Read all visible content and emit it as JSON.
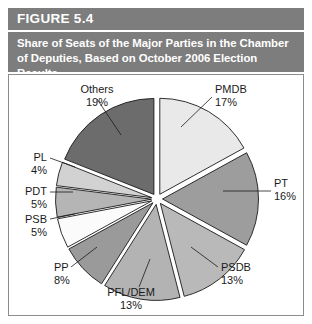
{
  "figure": {
    "number_label": "FIGURE 5.4",
    "caption": "Share of Seats of the Major Parties in the Chamber of Deputies, Based on October 2006 Election Results",
    "header_color": "#7d7d7d",
    "panel_background": "#ffffff",
    "border_color": "#8c8c8c"
  },
  "chart_data": {
    "type": "pie",
    "title": "Share of Seats of the Major Parties in the Chamber of Deputies, Based on October 2006 Election Results",
    "xlabel": "",
    "ylabel": "",
    "exploded": true,
    "legend": "none",
    "labels_placement": "outside-with-leader-lines",
    "categories": [
      "PMDB",
      "PT",
      "PSDB",
      "PFL/DEM",
      "PP",
      "PSB",
      "PDT",
      "PL",
      "Others"
    ],
    "values": [
      17,
      16,
      13,
      13,
      8,
      5,
      5,
      4,
      19
    ],
    "value_unit": "%",
    "slices": [
      {
        "label": "PMDB",
        "value": 17,
        "value_text": "17%",
        "color": "#e9e9e9"
      },
      {
        "label": "PT",
        "value": 16,
        "value_text": "16%",
        "color": "#9d9d9d"
      },
      {
        "label": "PSDB",
        "value": 13,
        "value_text": "13%",
        "color": "#b9b9b9"
      },
      {
        "label": "PFL/DEM",
        "value": 13,
        "value_text": "13%",
        "color": "#b3b3b3"
      },
      {
        "label": "PP",
        "value": 8,
        "value_text": "8%",
        "color": "#9a9a9a"
      },
      {
        "label": "PSB",
        "value": 5,
        "value_text": "5%",
        "color": "#fbfbfb"
      },
      {
        "label": "PDT",
        "value": 5,
        "value_text": "5%",
        "color": "#b5b5b5"
      },
      {
        "label": "PL",
        "value": 4,
        "value_text": "4%",
        "color": "#d2d2d2"
      },
      {
        "label": "Others",
        "value": 19,
        "value_text": "19%",
        "color": "#6c6c6c"
      }
    ]
  }
}
